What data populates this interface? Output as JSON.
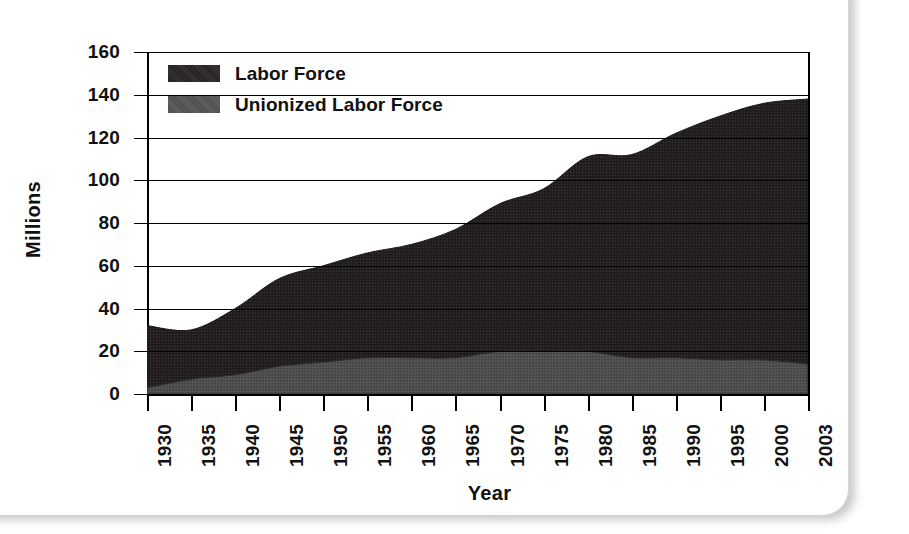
{
  "figure": {
    "y_axis_title": "Millions",
    "x_axis_title": "Year"
  },
  "legend": {
    "items": [
      {
        "label": "Labor Force",
        "color": "#231f20"
      },
      {
        "label": "Unionized Labor Force",
        "color": "#4d4d4f"
      }
    ]
  },
  "y_ticks": [
    "160",
    "140",
    "120",
    "100",
    "80",
    "60",
    "40",
    "20",
    "0"
  ],
  "x_ticks": [
    "1930",
    "1935",
    "1940",
    "1945",
    "1950",
    "1955",
    "1960",
    "1965",
    "1970",
    "1975",
    "1980",
    "1985",
    "1990",
    "1995",
    "2000",
    "2003"
  ],
  "chart_data": {
    "type": "area",
    "title": "",
    "subtitle": "",
    "xlabel": "Year",
    "ylabel": "Millions",
    "xlim": [
      1930,
      2003
    ],
    "ylim": [
      0,
      160
    ],
    "ytick_step": 20,
    "grid": true,
    "grid_axis": "y",
    "stacked": true,
    "legend_position": "top-left-inside",
    "x": [
      1930,
      1935,
      1940,
      1945,
      1950,
      1955,
      1960,
      1965,
      1970,
      1975,
      1980,
      1985,
      1990,
      1995,
      2000,
      2003
    ],
    "series": [
      {
        "name": "Unionized Labor Force",
        "color": "#4d4d4f",
        "values": [
          3,
          7,
          9,
          13,
          15,
          17,
          17,
          17,
          20,
          20,
          20,
          17,
          17,
          16,
          16,
          14
        ]
      },
      {
        "name": "Labor Force",
        "color": "#231f20",
        "note": "Values are the total labor force (top of stack).",
        "values": [
          32,
          30,
          40,
          54,
          60,
          66,
          70,
          77,
          89,
          96,
          111,
          112,
          122,
          130,
          136,
          138
        ]
      }
    ]
  }
}
